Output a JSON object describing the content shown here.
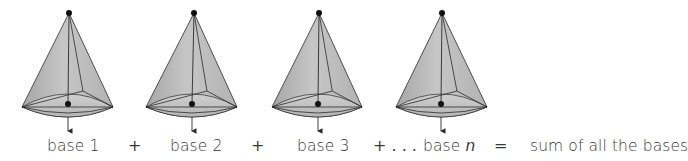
{
  "diagram": {
    "colors": {
      "cone_fill_light": "#c9c9c9",
      "cone_fill_dark": "#9a9a9a",
      "edge": "#2b2b2b",
      "text": "#3a3a3a"
    },
    "cones": [
      {
        "id": "cone-1",
        "label": "base 1",
        "apex": [
          69,
          13
        ],
        "left": [
          22,
          107
        ],
        "right": [
          113,
          107
        ],
        "center": [
          68,
          104
        ]
      },
      {
        "id": "cone-2",
        "label": "base 2",
        "apex": [
          194,
          13
        ],
        "left": [
          146,
          107
        ],
        "right": [
          237,
          107
        ],
        "center": [
          192,
          104
        ]
      },
      {
        "id": "cone-3",
        "label": "base 3",
        "apex": [
          319,
          13
        ],
        "left": [
          272,
          107
        ],
        "right": [
          362,
          107
        ],
        "center": [
          318,
          104
        ]
      },
      {
        "id": "cone-n",
        "label_prefix": "base ",
        "label_var": "n",
        "apex": [
          442,
          13
        ],
        "left": [
          396,
          107
        ],
        "right": [
          487,
          107
        ],
        "center": [
          441,
          104
        ]
      }
    ],
    "operators": {
      "plus_1": "+",
      "plus_2": "+",
      "plus_ellipsis": "+ . . .",
      "equals": "="
    },
    "result_label": "sum of all the bases"
  }
}
